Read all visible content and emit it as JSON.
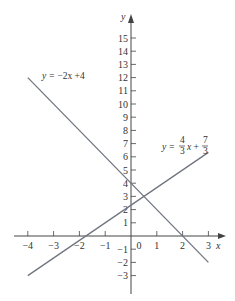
{
  "chart_data": {
    "type": "line",
    "title": "",
    "xlabel": "x",
    "ylabel": "y",
    "xlim": [
      -4.5,
      3.7
    ],
    "ylim": [
      -4.4,
      16.8
    ],
    "x_ticks": [
      -4,
      -3,
      -2,
      -1,
      0,
      1,
      2,
      3
    ],
    "y_ticks": [
      -3,
      -2,
      -1,
      1,
      2,
      3,
      4,
      5,
      6,
      7,
      8,
      9,
      10,
      11,
      12,
      13,
      14,
      15
    ],
    "grid": false,
    "series": [
      {
        "name": "y = -2x + 4",
        "label_parts": {
          "lhs": "y = ",
          "rhs": "−2x +4"
        },
        "x": [
          -4,
          3
        ],
        "y": [
          12,
          -2
        ],
        "color": "#707580"
      },
      {
        "name": "y = 4/3 x + 7/3",
        "label_parts": {
          "lhs": "y = ",
          "n1": "4",
          "d1": "3",
          "mid": "x + ",
          "n2": "7",
          "d2": "3"
        },
        "x": [
          -4,
          3
        ],
        "y": [
          -3,
          6.333
        ],
        "color": "#707580"
      }
    ],
    "annotations": [
      {
        "text": "y = −2x +4",
        "near": [
          -3.2,
          12.6
        ]
      },
      {
        "text": "y = (4/3)x + (7/3)",
        "near": [
          1.5,
          7
        ]
      }
    ]
  },
  "layout": {
    "origin_px": [
      131,
      236
    ],
    "x_unit_px": 25.8,
    "y_unit_px": 13.2,
    "axis_color": "#444444"
  }
}
